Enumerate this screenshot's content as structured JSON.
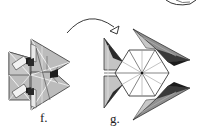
{
  "diagram": {
    "type": "origami-instruction-steps",
    "steps": [
      {
        "id": "f",
        "label": "f.",
        "description": "folded unit assembly, two stacked arrow shapes pointing right"
      },
      {
        "id": "g",
        "label": "g.",
        "description": "result: hexagonal center with radial creases and three triangular points"
      }
    ],
    "arrow": {
      "kind": "curved-transition-arrow",
      "from": "f",
      "to": "g"
    },
    "colors": {
      "paper_light": "#ffffff",
      "paper_gray": "#b9b9b9",
      "paper_mid": "#8c8c8c",
      "paper_dark": "#2a2a2a",
      "line": "#222222"
    }
  }
}
